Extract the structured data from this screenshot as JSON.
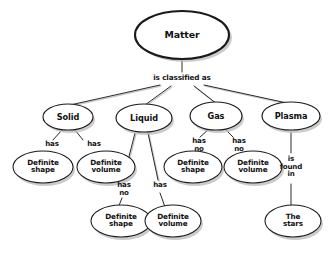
{
  "diagram": {
    "type": "concept-map",
    "background_color": "#ffffff",
    "node_fill": "#ffffff",
    "node_stroke": "#1a1a1a",
    "shadow_color": "#bdbdbd",
    "root": {
      "id": "matter",
      "label": "Matter"
    },
    "root_edge_label": "is classified as",
    "categories": [
      {
        "id": "solid",
        "label": "Solid",
        "properties": [
          {
            "id": "solid-shape",
            "relation": "has",
            "label": "Definite\nshape"
          },
          {
            "id": "solid-volume",
            "relation": "has",
            "label": "Definite\nvolume"
          }
        ]
      },
      {
        "id": "liquid",
        "label": "Liquid",
        "properties": [
          {
            "id": "liquid-shape",
            "relation": "has\nno",
            "label": "Definite\nshape"
          },
          {
            "id": "liquid-volume",
            "relation": "has",
            "label": "Definite\nvolume"
          }
        ]
      },
      {
        "id": "gas",
        "label": "Gas",
        "properties": [
          {
            "id": "gas-shape",
            "relation": "has\nno",
            "label": "Definite\nshape"
          },
          {
            "id": "gas-volume",
            "relation": "has\nno",
            "label": "Definite\nvolume"
          }
        ]
      },
      {
        "id": "plasma",
        "label": "Plasma",
        "properties": [
          {
            "id": "plasma-stars",
            "relation": "is\nfound\nin",
            "label": "The\nstars"
          }
        ]
      }
    ]
  }
}
